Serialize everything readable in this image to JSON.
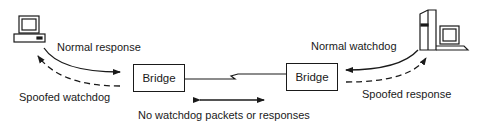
{
  "diagram": {
    "nodes": {
      "left_bridge": {
        "label": "Bridge"
      },
      "right_bridge": {
        "label": "Bridge"
      },
      "left_host": {
        "icon": "desktop-computer-icon"
      },
      "right_host": {
        "icon": "tower-computer-icon"
      }
    },
    "labels": {
      "normal_response": "Normal response",
      "spoofed_watchdog": "Spoofed watchdog",
      "normal_watchdog": "Normal watchdog",
      "spoofed_response": "Spoofed response",
      "no_watchdog": "No watchdog packets or responses"
    },
    "colors": {
      "stroke": "#1a1a1a",
      "background": "#ffffff"
    }
  }
}
